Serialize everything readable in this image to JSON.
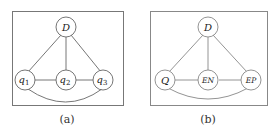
{
  "panels": [
    {
      "caption": "(a)",
      "nodes": [
        {
          "id": "D",
          "label": "D",
          "sub": ""
        },
        {
          "id": "q1",
          "label": "q",
          "sub": "1"
        },
        {
          "id": "q2",
          "label": "q",
          "sub": "2"
        },
        {
          "id": "q3",
          "label": "q",
          "sub": "3"
        }
      ],
      "edges": [
        [
          "D",
          "q1"
        ],
        [
          "D",
          "q2"
        ],
        [
          "D",
          "q3"
        ],
        [
          "q1",
          "q2"
        ],
        [
          "q2",
          "q3"
        ],
        [
          "q1",
          "q3"
        ]
      ]
    },
    {
      "caption": "(b)",
      "nodes": [
        {
          "id": "D",
          "label": "D",
          "sub": ""
        },
        {
          "id": "Q",
          "label": "Q",
          "sub": ""
        },
        {
          "id": "EN",
          "label": "EN",
          "sub": ""
        },
        {
          "id": "EP",
          "label": "EP",
          "sub": ""
        }
      ],
      "edges": [
        [
          "D",
          "Q"
        ],
        [
          "D",
          "EN"
        ],
        [
          "D",
          "EP"
        ],
        [
          "Q",
          "EN"
        ],
        [
          "EN",
          "EP"
        ],
        [
          "Q",
          "EP"
        ]
      ]
    }
  ]
}
